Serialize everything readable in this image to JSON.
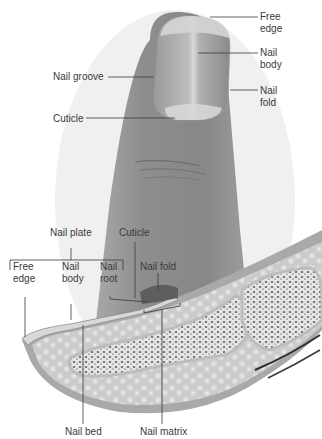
{
  "figure": {
    "top_view": {
      "labels": {
        "free_edge": "Free\nedge",
        "nail_body": "Nail\nbody",
        "nail_groove": "Nail groove",
        "nail_fold": "Nail\nfold",
        "cuticle": "Cuticle"
      }
    },
    "section_view": {
      "labels": {
        "nail_plate": "Nail plate",
        "cuticle": "Cuticle",
        "free_edge": "Free\nedge",
        "nail_body": "Nail\nbody",
        "nail_root": "Nail\nroot",
        "nail_fold": "Nail fold",
        "nail_bed": "Nail bed",
        "nail_matrix": "Nail matrix"
      }
    },
    "colors": {
      "skin": "#8f8f8f",
      "nail": "#b4b4b4",
      "bone": "#e2e2e2",
      "fat": "#cfcfcf",
      "line": "#3a3a3a"
    }
  }
}
